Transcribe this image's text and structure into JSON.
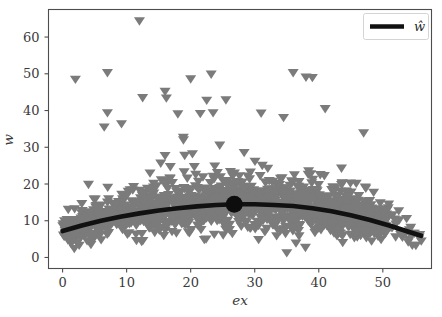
{
  "chart_data": {
    "type": "scatter",
    "title": "",
    "subtitle": "",
    "xlabel": "ex",
    "ylabel": "w",
    "xlim": [
      -2.2,
      57.6
    ],
    "ylim": [
      -3.0,
      67.5
    ],
    "xticks": [
      0,
      10,
      20,
      30,
      40,
      50
    ],
    "yticks": [
      0,
      10,
      20,
      30,
      40,
      50,
      60
    ],
    "xtick_labels": [
      "0",
      "10",
      "20",
      "30",
      "40",
      "50"
    ],
    "ytick_labels": [
      "0",
      "10",
      "20",
      "30",
      "40",
      "50",
      "60"
    ],
    "grid": false,
    "legend": {
      "position": "upper right",
      "entries": [
        {
          "label": "ŵ",
          "type": "line",
          "color": "#111111",
          "linewidth": 4.6
        }
      ]
    },
    "series": [
      {
        "name": "observations",
        "type": "scatter",
        "marker": "triangle-down",
        "color": "#7b7b7b",
        "marker_size": 6,
        "point_count": 1400,
        "x_range": [
          0,
          56
        ],
        "y_range": [
          0.5,
          64.5
        ],
        "description": "Dense cloud of downward triangles; bulk between w=2 and w=22, long upper tail of outliers to w=64.5, density highest for ex between 0 and 45 and thinning beyond ex=45."
      },
      {
        "name": "ŵ",
        "type": "line",
        "color": "#111111",
        "linewidth": 4.6,
        "description": "Smooth concave fitted curve peaking near ex=27.",
        "x": [
          0,
          3,
          6,
          9,
          12,
          15,
          18,
          21,
          24,
          27,
          30,
          33,
          36,
          39,
          42,
          45,
          48,
          51,
          54,
          56
        ],
        "y": [
          7.2,
          8.7,
          10.0,
          11.1,
          12.0,
          12.8,
          13.4,
          13.9,
          14.3,
          14.5,
          14.5,
          14.3,
          14.0,
          13.4,
          12.6,
          11.5,
          10.2,
          8.7,
          7.0,
          5.9
        ]
      },
      {
        "name": "highlighted-point",
        "type": "scatter",
        "marker": "circle",
        "color": "#0d0d0d",
        "marker_size": 17,
        "x": [
          26.8
        ],
        "y": [
          14.5
        ],
        "description": "Large black dot marking a point of interest on the fitted curve."
      }
    ],
    "notable_outliers": [
      {
        "x": 12.0,
        "y": 64.5
      },
      {
        "x": 7.0,
        "y": 50.4
      },
      {
        "x": 23.2,
        "y": 50.0
      },
      {
        "x": 36.0,
        "y": 50.4
      },
      {
        "x": 2.0,
        "y": 48.6
      },
      {
        "x": 20.0,
        "y": 48.7
      },
      {
        "x": 38.0,
        "y": 49.2
      },
      {
        "x": 39.0,
        "y": 49.1
      },
      {
        "x": 16.0,
        "y": 45.3
      },
      {
        "x": 12.5,
        "y": 43.6
      },
      {
        "x": 16.2,
        "y": 43.5
      },
      {
        "x": 22.5,
        "y": 42.9
      },
      {
        "x": 25.5,
        "y": 43.0
      },
      {
        "x": 41.0,
        "y": 40.6
      },
      {
        "x": 7.0,
        "y": 39.5
      },
      {
        "x": 18.0,
        "y": 39.2
      },
      {
        "x": 21.5,
        "y": 39.3
      },
      {
        "x": 23.5,
        "y": 39.5
      },
      {
        "x": 31.0,
        "y": 39.4
      },
      {
        "x": 34.5,
        "y": 38.2
      },
      {
        "x": 9.2,
        "y": 36.5
      },
      {
        "x": 6.5,
        "y": 35.6
      },
      {
        "x": 47.0,
        "y": 34.0
      },
      {
        "x": 35.0,
        "y": 1.4
      },
      {
        "x": 51.5,
        "y": 11.7
      },
      {
        "x": 52.0,
        "y": 5.7
      },
      {
        "x": 56.0,
        "y": 4.6
      }
    ]
  },
  "figure": {
    "background_color": "#ffffff",
    "axes_color": "#4d4d4d",
    "marker_color": "#7b7b7b",
    "curve_color": "#111111"
  }
}
